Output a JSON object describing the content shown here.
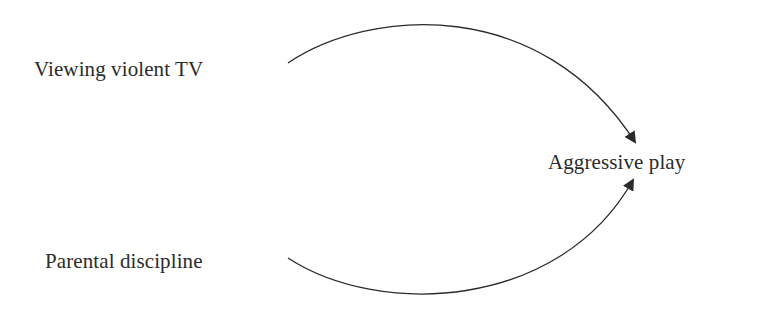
{
  "diagram": {
    "type": "path-diagram",
    "nodes": [
      {
        "id": "tv",
        "label": "Viewing violent TV",
        "role": "predictor"
      },
      {
        "id": "aggr",
        "label": "Aggressive play",
        "role": "outcome"
      },
      {
        "id": "disc",
        "label": "Parental discipline",
        "role": "predictor"
      }
    ],
    "edges": [
      {
        "from": "tv",
        "to": "aggr",
        "style": "curved-arrow"
      },
      {
        "from": "disc",
        "to": "aggr",
        "style": "curved-arrow"
      }
    ],
    "colors": {
      "background": "#ffffff",
      "ink": "#2b2b2b"
    }
  }
}
